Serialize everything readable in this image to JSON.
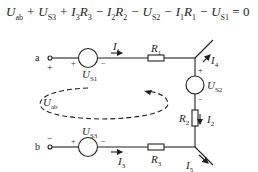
{
  "equation": {
    "terms": [
      {
        "sym": "U",
        "sub": "ab",
        "op": ""
      },
      {
        "sym": "U",
        "sub": "S3",
        "op": "+"
      },
      {
        "sym": "I",
        "sub": "3",
        "sym2": "R",
        "sub2": "3",
        "op": "+"
      },
      {
        "sym": "I",
        "sub": "2",
        "sym2": "R",
        "sub2": "2",
        "op": "−"
      },
      {
        "sym": "U",
        "sub": "S2",
        "op": "−"
      },
      {
        "sym": "I",
        "sub": "1",
        "sym2": "R",
        "sub2": "1",
        "op": "−"
      },
      {
        "sym": "U",
        "sub": "S1",
        "op": "−"
      }
    ],
    "rhs": "= 0"
  },
  "nodes": {
    "a": {
      "label": "a",
      "polarity": "+"
    },
    "b": {
      "label": "b",
      "polarity": "−"
    }
  },
  "sources": {
    "us1": {
      "sym": "U",
      "sub": "S1",
      "plus": "+",
      "minus": "−"
    },
    "us2": {
      "sym": "U",
      "sub": "S2",
      "plus": "+",
      "minus": "−"
    },
    "us3": {
      "sym": "U",
      "sub": "S3",
      "plus": "+",
      "minus": "−"
    }
  },
  "resistors": {
    "r1": {
      "sym": "R",
      "sub": "1"
    },
    "r2": {
      "sym": "R",
      "sub": "2"
    },
    "r3": {
      "sym": "R",
      "sub": "3"
    }
  },
  "currents": {
    "i1": {
      "sym": "I",
      "sub": "1"
    },
    "i2": {
      "sym": "I",
      "sub": "2"
    },
    "i3": {
      "sym": "I",
      "sub": "3"
    },
    "i4": {
      "sym": "I",
      "sub": "4"
    },
    "i5": {
      "sym": "I",
      "sub": "5"
    }
  },
  "loop": {
    "sym": "U",
    "sub": "ab"
  },
  "colors": {
    "ink": "#231f20",
    "background": "#ffffff"
  }
}
